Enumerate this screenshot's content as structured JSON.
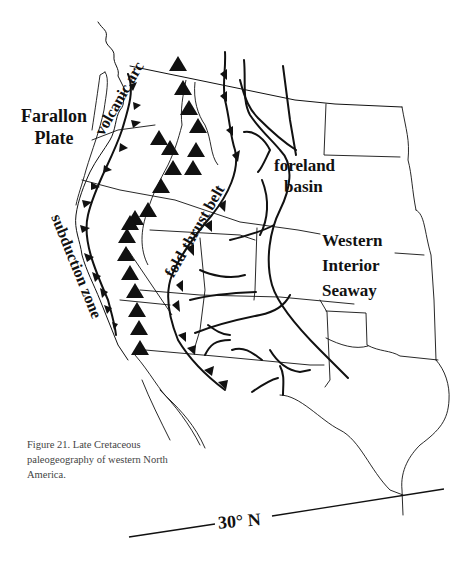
{
  "map": {
    "title": "Late Cretaceous paleogeography of western North America",
    "labels": {
      "farallon_plate_line1": "Farallon",
      "farallon_plate_line2": "Plate",
      "volcanic_arc": "volcanic arc",
      "fold_thrust_belt": "fold-thrust belt",
      "foreland_basin_line1": "foreland",
      "foreland_basin_line2": "basin",
      "subduction_zone": "subduction zone",
      "seaway_line1": "Western",
      "seaway_line2": "Interior",
      "seaway_line3": "Seaway",
      "latitude": "30° N"
    },
    "caption": "Figure 21. Late Cretaceous paleogeography of western North America.",
    "colors": {
      "ink": "#111111",
      "caption_text": "#444444",
      "background": "#ffffff"
    }
  }
}
